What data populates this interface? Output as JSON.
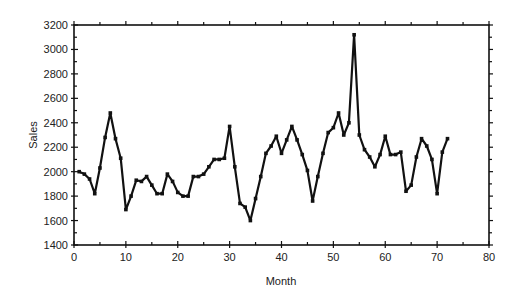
{
  "chart_data": {
    "type": "line",
    "title": "",
    "xlabel": "Month",
    "ylabel": "Sales",
    "xlim": [
      0,
      80
    ],
    "ylim": [
      1400,
      3200
    ],
    "x_ticks": [
      0,
      10,
      20,
      30,
      40,
      50,
      60,
      70,
      80
    ],
    "y_ticks": [
      1400,
      1600,
      1800,
      2000,
      2200,
      2400,
      2600,
      2800,
      3000,
      3200
    ],
    "grid": false,
    "legend": null,
    "markers": true,
    "series": [
      {
        "name": "Sales",
        "x": [
          1,
          2,
          3,
          4,
          5,
          6,
          7,
          8,
          9,
          10,
          11,
          12,
          13,
          14,
          15,
          16,
          17,
          18,
          19,
          20,
          21,
          22,
          23,
          24,
          25,
          26,
          27,
          28,
          29,
          30,
          31,
          32,
          33,
          34,
          35,
          36,
          37,
          38,
          39,
          40,
          41,
          42,
          43,
          44,
          45,
          46,
          47,
          48,
          49,
          50,
          51,
          52,
          53,
          54,
          55,
          56,
          57,
          58,
          59,
          60,
          61,
          62,
          63,
          64,
          65,
          66,
          67,
          68,
          69,
          70,
          71,
          72
        ],
        "values": [
          2000,
          1980,
          1940,
          1820,
          2030,
          2280,
          2480,
          2270,
          2110,
          1690,
          1800,
          1930,
          1920,
          1960,
          1890,
          1820,
          1820,
          1980,
          1920,
          1830,
          1800,
          1800,
          1960,
          1960,
          1980,
          2040,
          2100,
          2100,
          2110,
          2370,
          2040,
          1740,
          1710,
          1600,
          1780,
          1960,
          2150,
          2210,
          2290,
          2150,
          2260,
          2370,
          2260,
          2140,
          2010,
          1760,
          1960,
          2150,
          2320,
          2360,
          2480,
          2300,
          2400,
          3120,
          2300,
          2180,
          2120,
          2040,
          2140,
          2290,
          2140,
          2140,
          2160,
          1840,
          1890,
          2120,
          2270,
          2210,
          2100,
          1820,
          2160,
          2270
        ]
      }
    ]
  }
}
